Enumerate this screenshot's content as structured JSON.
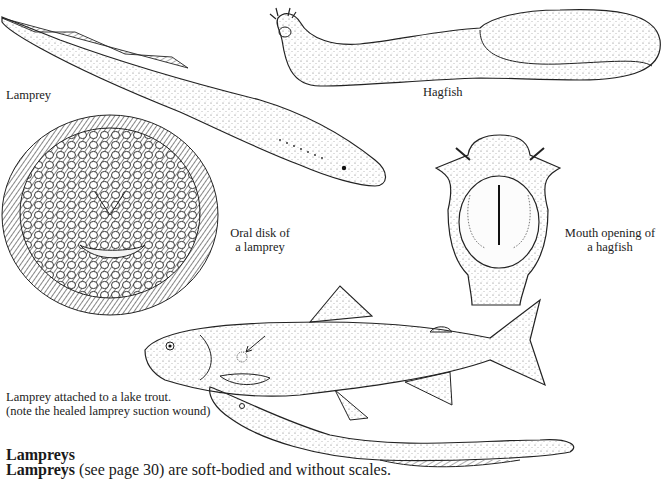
{
  "figures": {
    "lamprey": {
      "caption": "Lamprey"
    },
    "hagfish": {
      "caption": "Hagfish"
    },
    "oral_disk": {
      "caption_line1": "Oral disk of",
      "caption_line2": "a lamprey"
    },
    "hagfish_mouth": {
      "caption_line1": "Mouth opening of",
      "caption_line2": "a hagfish"
    },
    "lake_trout": {
      "caption_line1": "Lamprey attached to a lake trout.",
      "caption_line2": "(note the healed lamprey suction wound)"
    }
  },
  "section": {
    "heading": "Lampreys",
    "body_bold": "Lampreys",
    "body_rest": " (see page 30) are soft-bodied and without scales."
  },
  "colors": {
    "ink": "#1a1a1a",
    "paper": "#ffffff"
  }
}
